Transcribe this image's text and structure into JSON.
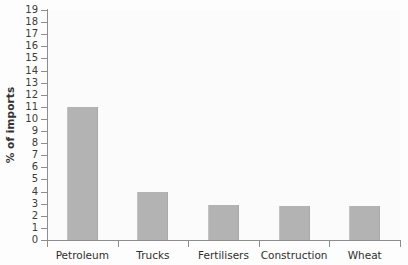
{
  "chart_data": {
    "type": "bar",
    "title": "",
    "xlabel": "",
    "ylabel": "% of imports",
    "categories": [
      "Petroleum",
      "Trucks",
      "Fertilisers",
      "Construction",
      "Wheat"
    ],
    "values": [
      11,
      4,
      2.9,
      2.85,
      2.8
    ],
    "ylim": [
      0,
      19
    ],
    "ytick_step": 1,
    "yticks": [
      0,
      1,
      2,
      3,
      4,
      5,
      6,
      7,
      8,
      9,
      10,
      11,
      12,
      13,
      14,
      15,
      16,
      17,
      18,
      19
    ],
    "ytick_labels": [
      "0",
      "1",
      "2",
      "3",
      "4",
      "5",
      "6",
      "7",
      "8",
      "9",
      "10",
      "11",
      "12",
      "13",
      "14",
      "15",
      "16",
      "17",
      "18",
      "19"
    ],
    "grid": false,
    "legend": null,
    "series": [
      {
        "name": "% of imports",
        "values": [
          11,
          4,
          2.9,
          2.85,
          2.8
        ],
        "color": "#b3b3b3"
      }
    ],
    "colors": {
      "bar": "#b3b3b3",
      "axis": "#8d8d8d",
      "text": "#3a3a3a",
      "background": "#fdfdfd",
      "plot_background": "#fbfbfb"
    }
  }
}
